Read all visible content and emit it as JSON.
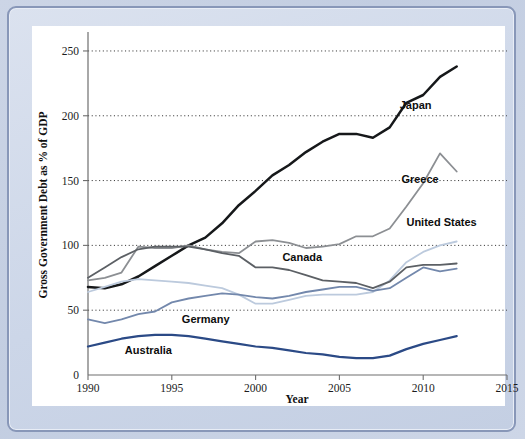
{
  "figure": {
    "background_color": "#c8d2e4",
    "card_color": "#ffffff",
    "frame_border_color": "#8897b8"
  },
  "chart_data": {
    "type": "line",
    "title": "",
    "xlabel": "Year",
    "ylabel": "Gross Government Debt as % of GDP",
    "xlim": [
      1990,
      2015
    ],
    "ylim": [
      0,
      260
    ],
    "xticks": [
      1990,
      1995,
      2000,
      2005,
      2010,
      2015
    ],
    "xticklabels": [
      "1990",
      "1995",
      "2000",
      "2005",
      "2010",
      "2015"
    ],
    "yticks": [
      0,
      50,
      100,
      150,
      200,
      250
    ],
    "yticklabels": [
      "0",
      "50",
      "100",
      "150",
      "200",
      "250"
    ],
    "grid": "horizontal-dotted",
    "gridlines_at": [
      50,
      100,
      150,
      200,
      250
    ],
    "legend": "inline-annotations",
    "x": [
      1990,
      1991,
      1992,
      1993,
      1994,
      1995,
      1996,
      1997,
      1998,
      1999,
      2000,
      2001,
      2002,
      2003,
      2004,
      2005,
      2006,
      2007,
      2008,
      2009,
      2010,
      2011,
      2012
    ],
    "series": [
      {
        "name": "Japan",
        "color": "#16181a",
        "width": 2.5,
        "label_x": 2008.6,
        "label_y": 205,
        "values": [
          68,
          67,
          70,
          76,
          84,
          92,
          100,
          106,
          117,
          131,
          142,
          154,
          162,
          172,
          180,
          186,
          186,
          183,
          191,
          210,
          216,
          230,
          238
        ]
      },
      {
        "name": "Greece",
        "color": "#8c8f93",
        "width": 1.8,
        "label_x": 2008.7,
        "label_y": 148,
        "values": [
          73,
          75,
          79,
          99,
          98,
          98,
          100,
          97,
          95,
          94,
          103,
          104,
          102,
          98,
          99,
          101,
          107,
          107,
          113,
          130,
          148,
          171,
          157
        ]
      },
      {
        "name": "United States",
        "color": "#bccadd",
        "width": 1.8,
        "label_x": 2009.0,
        "label_y": 115,
        "values": [
          64,
          68,
          72,
          74,
          73,
          72,
          71,
          69,
          67,
          62,
          55,
          55,
          58,
          61,
          62,
          62,
          62,
          64,
          73,
          87,
          95,
          100,
          103
        ]
      },
      {
        "name": "Canada",
        "color": "#5c6065",
        "width": 1.8,
        "label_x": 2001.6,
        "label_y": 88,
        "values": [
          75,
          83,
          91,
          97,
          99,
          99,
          99,
          97,
          94,
          92,
          83,
          83,
          81,
          77,
          73,
          72,
          71,
          67,
          72,
          83,
          85,
          85,
          86
        ]
      },
      {
        "name": "Germany",
        "color": "#7388ac",
        "width": 1.8,
        "label_x": 1995.6,
        "label_y": 40,
        "values": [
          43,
          40,
          43,
          47,
          49,
          56,
          59,
          61,
          63,
          62,
          60,
          59,
          61,
          64,
          66,
          68,
          68,
          65,
          67,
          75,
          83,
          80,
          82
        ]
      },
      {
        "name": "Australia",
        "color": "#2b4a86",
        "width": 2.2,
        "label_x": 1992.2,
        "label_y": 16,
        "values": [
          22,
          25,
          28,
          30,
          31,
          31,
          30,
          28,
          26,
          24,
          22,
          21,
          19,
          17,
          16,
          14,
          13,
          13,
          15,
          20,
          24,
          27,
          30
        ]
      }
    ]
  }
}
